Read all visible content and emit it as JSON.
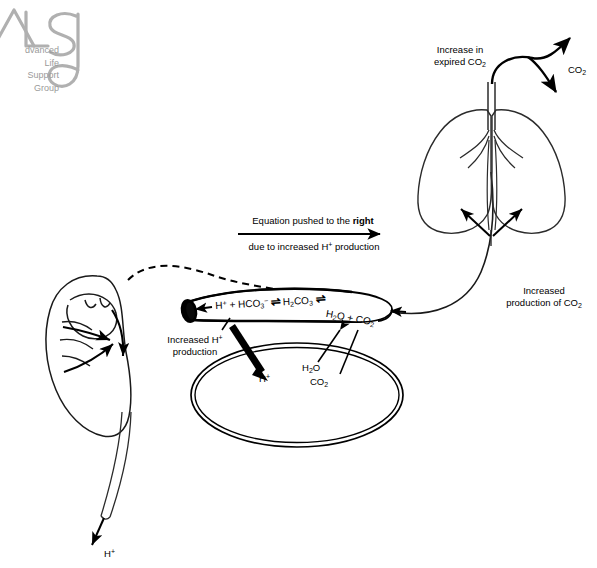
{
  "diagram": {
    "logo": {
      "mark": "alsg-logo",
      "lines": [
        "dvanced",
        "Life",
        "Support",
        "Group"
      ]
    },
    "equation_banner": {
      "line1_prefix": "Equation pushed to the ",
      "line1_emphasis": "right",
      "line2": "due to increased H",
      "line2_sup": "+",
      "line2_suffix": " production",
      "arrow": "right-arrow"
    },
    "equation": {
      "terms": [
        "H",
        "HCO",
        "H",
        "H",
        "CO"
      ],
      "full_text": "H+ + HCO3- ⇌ H2CO3 ⇌ H2O + CO2",
      "t1": "H",
      "t1_sup": "+",
      "plus1": "+",
      "t2": "HCO",
      "t2_sub": "3",
      "t2_sup": "−",
      "eq1": "⇌",
      "t3": "H",
      "t3_sub": "2",
      "t3b": "CO",
      "t3_sub2": "3",
      "eq2": "⇌",
      "t4": "H",
      "t4_sub": "2",
      "t4b": "O",
      "plus2": "+",
      "t5": "CO",
      "t5_sub": "2"
    },
    "labels": {
      "increased_h_production": {
        "line1": "Increased H",
        "sup": "+",
        "line2": "production"
      },
      "h_plus_cell": {
        "text": "H",
        "sup": "+"
      },
      "h2o_cell": {
        "text": "H",
        "sub": "2",
        "text2": "O"
      },
      "co2_cell": {
        "text": "CO",
        "sub": "2"
      },
      "increased_co2_production": {
        "line1": "Increased",
        "line2_prefix": "production of CO",
        "line2_sub": "2"
      },
      "increase_expired_co2": {
        "line1": "Increase in",
        "line2_prefix": "expired CO",
        "line2_sub": "2"
      },
      "co2_exhaled": {
        "text": "CO",
        "sub": "2"
      },
      "h_plus_excreted": {
        "text": "H",
        "sup": "+"
      }
    },
    "organs": {
      "kidney": "kidney",
      "lungs": "lungs",
      "tubule": "renal-tubule",
      "cell": "cell-membrane-loop",
      "ureter": "ureter"
    },
    "colors": {
      "ink": "#000000",
      "logo_gray": "#9a9a9a",
      "background": "#ffffff",
      "thin_line": "#2b2b2b"
    }
  }
}
